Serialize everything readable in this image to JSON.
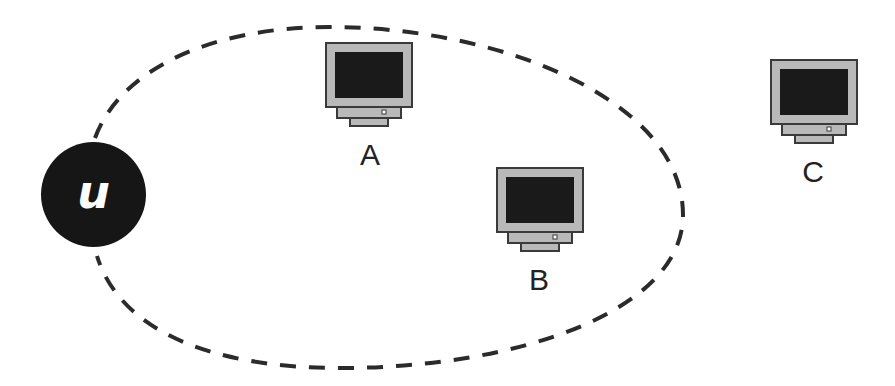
{
  "diagram": {
    "user": {
      "label": "u"
    },
    "nodes": [
      {
        "id": "A",
        "label": "A",
        "inside_range": true
      },
      {
        "id": "B",
        "label": "B",
        "inside_range": true
      },
      {
        "id": "C",
        "label": "C",
        "inside_range": false
      }
    ],
    "range_boundary": {
      "style": "dashed",
      "color": "#2b2b2b"
    },
    "colors": {
      "user_fill": "#161616",
      "monitor_bezel": "#b9b9b9",
      "monitor_screen": "#1a1a1a",
      "monitor_outline": "#3a3a3a",
      "label_text": "#222222"
    }
  }
}
